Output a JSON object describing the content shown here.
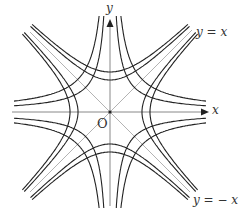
{
  "diagram": {
    "origin_px": [
      110,
      112
    ],
    "extent_px": 96,
    "colors": {
      "curve": "#222222",
      "axis": "#888888",
      "asymptote": "#aaaaaa",
      "text": "#333333"
    },
    "family_xy": {
      "equation": "xy = ±c",
      "c_values_px2": [
        600,
        1050
      ]
    },
    "family_x2y2": {
      "equation": "x^2 - y^2 = ±a^2",
      "a_values_px": [
        32,
        40
      ]
    },
    "labels": {
      "y_axis": "y",
      "x_axis": "x",
      "origin": "O",
      "line_pos": "y = x",
      "line_neg": "y = − x"
    }
  }
}
